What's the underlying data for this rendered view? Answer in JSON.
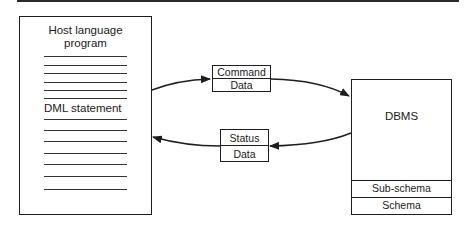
{
  "diagram": {
    "program_box": {
      "title_line1": "Host language",
      "title_line2": "program",
      "dml_label": "DML statement",
      "upper_rules_y": [
        56,
        65,
        73,
        82,
        90,
        98
      ],
      "lower_rules_y": [
        119,
        130,
        141,
        153,
        164,
        176,
        189
      ]
    },
    "request_message": {
      "top_label": "Command",
      "bottom_label": "Data"
    },
    "response_message": {
      "top_label": "Status",
      "bottom_label": "Data"
    },
    "dbms_box": {
      "label": "DBMS",
      "sub_schema_label": "Sub-schema",
      "schema_label": "Schema"
    },
    "arrows": [
      {
        "from": "program_box",
        "to": "request_message"
      },
      {
        "from": "request_message",
        "to": "dbms_box"
      },
      {
        "from": "dbms_box",
        "to": "response_message"
      },
      {
        "from": "response_message",
        "to": "program_box"
      }
    ],
    "colors": {
      "ink": "#1e1e1e",
      "background": "#ffffff"
    }
  }
}
